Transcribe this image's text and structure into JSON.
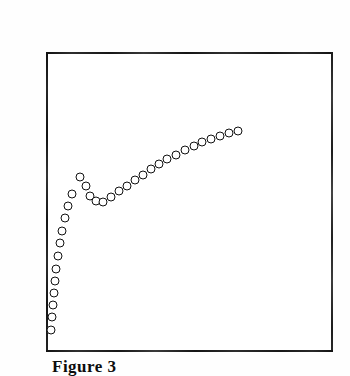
{
  "figure": {
    "caption": "Figure 3",
    "frame": {
      "x": 46,
      "y": 52,
      "width": 287,
      "height": 300,
      "border_color": "#1a1a1a"
    },
    "marker": {
      "style": "open-circle",
      "diameter": 9,
      "stroke_color": "#111111",
      "fill_color": "#ffffff"
    },
    "background_color": "#ffffff"
  },
  "chart_data": {
    "type": "scatter",
    "title": "Figure 3",
    "xlabel": "",
    "ylabel": "",
    "xticklabels": [],
    "yticklabels": [],
    "grid": false,
    "legend": null,
    "axis_box": true,
    "units": "pixels",
    "xlim": [
      46,
      333
    ],
    "ylim": [
      352,
      52
    ],
    "points_px": [
      {
        "x": 51,
        "y": 330
      },
      {
        "x": 52,
        "y": 317
      },
      {
        "x": 53,
        "y": 305
      },
      {
        "x": 54,
        "y": 293
      },
      {
        "x": 55,
        "y": 281
      },
      {
        "x": 56,
        "y": 269
      },
      {
        "x": 58,
        "y": 256
      },
      {
        "x": 60,
        "y": 243
      },
      {
        "x": 62,
        "y": 231
      },
      {
        "x": 65,
        "y": 218
      },
      {
        "x": 68,
        "y": 206
      },
      {
        "x": 72,
        "y": 194
      },
      {
        "x": 80,
        "y": 177
      },
      {
        "x": 86,
        "y": 186
      },
      {
        "x": 90,
        "y": 196
      },
      {
        "x": 96,
        "y": 201
      },
      {
        "x": 103,
        "y": 202
      },
      {
        "x": 111,
        "y": 197
      },
      {
        "x": 119,
        "y": 191
      },
      {
        "x": 127,
        "y": 186
      },
      {
        "x": 135,
        "y": 180
      },
      {
        "x": 143,
        "y": 175
      },
      {
        "x": 151,
        "y": 169
      },
      {
        "x": 159,
        "y": 164
      },
      {
        "x": 167,
        "y": 159
      },
      {
        "x": 176,
        "y": 155
      },
      {
        "x": 185,
        "y": 150
      },
      {
        "x": 194,
        "y": 146
      },
      {
        "x": 202,
        "y": 142
      },
      {
        "x": 211,
        "y": 139
      },
      {
        "x": 220,
        "y": 136
      },
      {
        "x": 229,
        "y": 133
      },
      {
        "x": 238,
        "y": 131
      }
    ]
  }
}
